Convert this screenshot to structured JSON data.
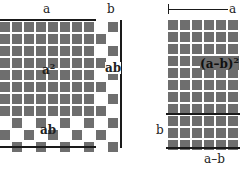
{
  "left_figure": {
    "top_label_a": "a",
    "top_label_b": "b",
    "area_a_squared": "a",
    "area_a_squared_exp": "2",
    "area_ab_right": "ab",
    "area_ab_bottom": "ab",
    "grid": {
      "cols": 10,
      "rows": 11,
      "a_cols": 8,
      "a_rows": 8
    }
  },
  "right_figure": {
    "top_label_a": "a",
    "area_label": "(a–b)",
    "area_label_exp": "2",
    "left_label_b": "b",
    "bottom_label": "a–b",
    "grid": {
      "cols": 6,
      "rows": 11,
      "strip_rows": 3
    }
  },
  "colors": {
    "cell": "#6e6e6e",
    "line": "#1a1a1a",
    "background": "#ffffff"
  }
}
